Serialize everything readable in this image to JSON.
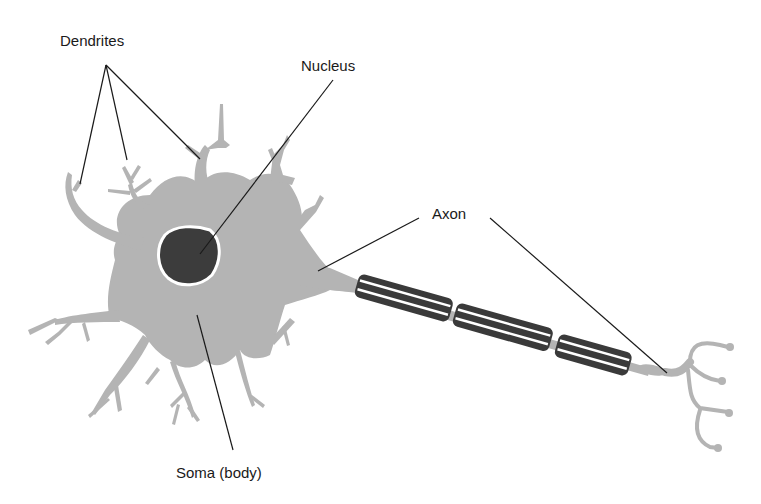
{
  "diagram": {
    "colors": {
      "cell_fill": "#b4b4b4",
      "nucleus_fill": "#3c3c3c",
      "nucleus_outline": "#ffffff",
      "myelin_fill": "#3a3a3a",
      "myelin_stripe": "#ffffff",
      "leader_line": "#1a1a1a",
      "background": "#ffffff"
    },
    "labels": {
      "dendrites": "Dendrites",
      "nucleus": "Nucleus",
      "axon": "Axon",
      "soma": "Soma (body)"
    },
    "myelin_segments": 3
  }
}
